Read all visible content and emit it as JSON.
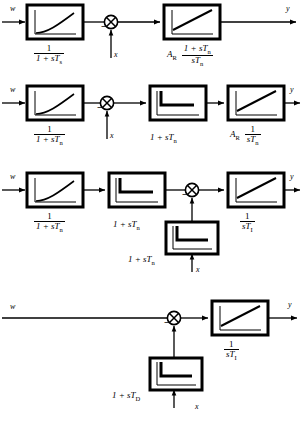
{
  "figure": {
    "type": "control-block-diagram",
    "signals": {
      "input": "w",
      "disturbance": "x",
      "output": "y"
    },
    "symbols": {
      "gain": "A",
      "gain_sub": "R",
      "s": "s",
      "T": "T",
      "sub_s": "s",
      "sub_n": "n",
      "sub_I": "I",
      "sub_D": "D",
      "one": "1",
      "plus": "+",
      "minus": "−"
    },
    "rows": [
      {
        "id": "row-1",
        "input_label": "w",
        "output_label": "y",
        "feedback_label": "x",
        "blocks": [
          {
            "id": "r1-b1",
            "icon": "first-order-lag-step-response",
            "label_num": "1",
            "label_den": "1 + sTs",
            "den_base": "1 + sT",
            "den_sub": "s",
            "kind": "fraction"
          },
          {
            "id": "r1-b2",
            "icon": "pi-ramp-step-response",
            "gain": "AR",
            "gain_base": "A",
            "gain_sub": "R",
            "label_num": "1 + sTn",
            "num_base": "1 + sT",
            "num_sub": "n",
            "label_den": "sTn",
            "den_base": "sT",
            "den_sub": "n",
            "kind": "gain-fraction"
          }
        ],
        "sum_junction": {
          "id": "r1-sum",
          "sign": "−"
        }
      },
      {
        "id": "row-2",
        "input_label": "w",
        "output_label": "y",
        "feedback_label": "x",
        "blocks": [
          {
            "id": "r2-b1",
            "icon": "first-order-lag-step-response",
            "label_num": "1",
            "label_den": "1 + sTn",
            "den_base": "1 + sT",
            "den_sub": "n",
            "kind": "fraction"
          },
          {
            "id": "r2-b2",
            "icon": "pd-impulse-step-response",
            "label": "1 + sTn",
            "base": "1 + sT",
            "sub": "n",
            "kind": "plain"
          },
          {
            "id": "r2-b3",
            "icon": "pi-ramp-step-response",
            "gain": "AR",
            "gain_base": "A",
            "gain_sub": "R",
            "label_num": "1",
            "label_den": "sTn",
            "den_base": "sT",
            "den_sub": "n",
            "kind": "gain-fraction"
          }
        ],
        "sum_junction": {
          "id": "r2-sum",
          "sign": "−"
        }
      },
      {
        "id": "row-3",
        "input_label": "w",
        "output_label": "y",
        "feedback_label": "x",
        "blocks": [
          {
            "id": "r3-b1",
            "icon": "first-order-lag-step-response",
            "label_num": "1",
            "label_den": "1 + sTn",
            "den_base": "1 + sT",
            "den_sub": "n",
            "kind": "fraction"
          },
          {
            "id": "r3-b2",
            "icon": "pd-impulse-step-response",
            "label": "1 + sTn",
            "base": "1 + sT",
            "sub": "n",
            "kind": "plain"
          },
          {
            "id": "r3-b3",
            "icon": "pi-ramp-step-response",
            "label_num": "1",
            "label_den": "sTI",
            "den_base": "sT",
            "den_sub": "I",
            "kind": "fraction"
          },
          {
            "id": "r3-b4",
            "icon": "pd-impulse-step-response",
            "label": "1 + sTn",
            "base": "1 + sT",
            "sub": "n",
            "kind": "plain",
            "position": "below"
          }
        ],
        "sum_junction": {
          "id": "r3-sum",
          "sign": "−"
        }
      },
      {
        "id": "row-4",
        "input_label": "w",
        "output_label": "y",
        "feedback_label": "x",
        "blocks": [
          {
            "id": "r4-b1",
            "icon": "pi-ramp-step-response",
            "label_num": "1",
            "label_den": "sTI",
            "den_base": "sT",
            "den_sub": "I",
            "kind": "fraction"
          },
          {
            "id": "r4-b2",
            "icon": "pd-impulse-step-response",
            "label": "1 + sTD",
            "base": "1 + sT",
            "sub": "D",
            "kind": "plain",
            "position": "below"
          }
        ],
        "sum_junction": {
          "id": "r4-sum",
          "sign": "−"
        }
      }
    ],
    "colors": {
      "ink": "#000000",
      "paper": "#ffffff"
    }
  }
}
